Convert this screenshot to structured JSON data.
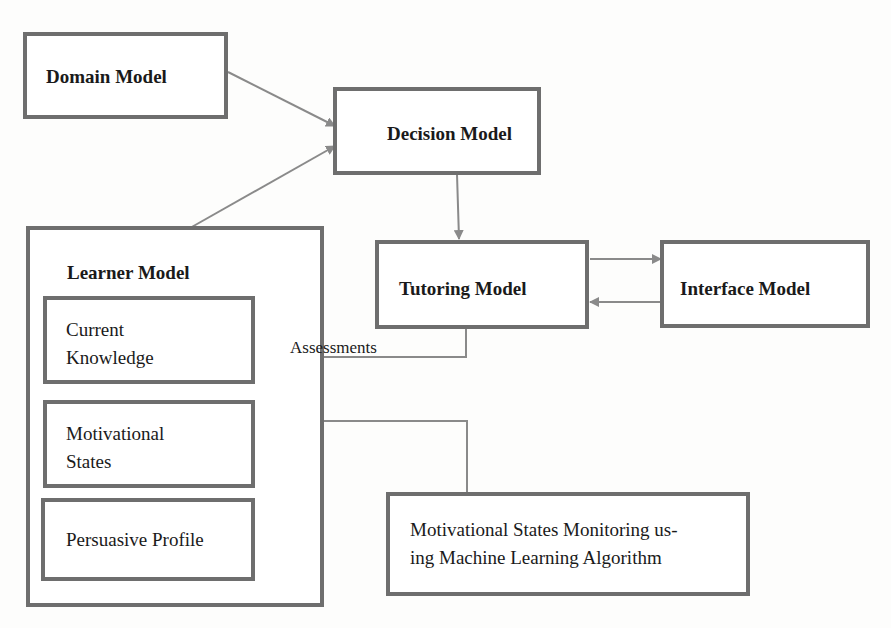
{
  "diagram": {
    "nodes": {
      "domain_model": {
        "label": "Domain Model"
      },
      "decision_model": {
        "label": "Decision Model"
      },
      "tutoring_model": {
        "label": "Tutoring Model"
      },
      "interface_model": {
        "label": "Interface Model"
      },
      "learner_model": {
        "label": "Learner Model",
        "components": [
          {
            "line1": "Current",
            "line2": "Knowledge"
          },
          {
            "line1": "Motivational",
            "line2": "States"
          },
          {
            "line1": "Persuasive Profile"
          }
        ]
      },
      "monitoring": {
        "line1": "Motivational States Monitoring us-",
        "line2": "ing Machine Learning Algorithm"
      }
    },
    "edges": [
      {
        "from": "Domain Model",
        "to": "Decision Model"
      },
      {
        "from": "Learner Model",
        "to": "Decision Model"
      },
      {
        "from": "Decision Model",
        "to": "Tutoring Model"
      },
      {
        "from": "Tutoring Model",
        "to": "Interface Model"
      },
      {
        "from": "Interface Model",
        "to": "Tutoring Model"
      },
      {
        "from": "Tutoring Model",
        "to": "Current Knowledge",
        "label": "Assessments"
      },
      {
        "from": "Motivational States Monitoring",
        "to": "Motivational States"
      }
    ],
    "edge_label_assessments": "Assessments",
    "colors": {
      "border": "#6e6e6e",
      "arrow": "#8a8a8a",
      "text": "#1a1a1a"
    }
  }
}
